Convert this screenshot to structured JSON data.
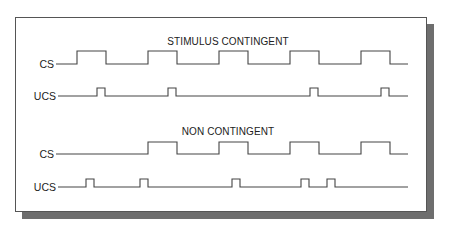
{
  "sections": [
    {
      "title": "STIMULUS CONTINGENT",
      "rows": [
        {
          "label": "CS",
          "start": 56,
          "end": 408,
          "low": 64,
          "high": 51,
          "pulses": [
            [
              77,
              106
            ],
            [
              148,
              177
            ],
            [
              219,
              248
            ],
            [
              290,
              319
            ],
            [
              361,
              390
            ]
          ]
        },
        {
          "label": "UCS",
          "start": 58,
          "end": 408,
          "low": 96,
          "high": 88,
          "pulses": [
            [
              97,
              105
            ],
            [
              168,
              176
            ],
            [
              310,
              318
            ],
            [
              381,
              389
            ]
          ]
        }
      ]
    },
    {
      "title": "NON CONTINGENT",
      "rows": [
        {
          "label": "CS",
          "start": 56,
          "end": 408,
          "low": 154,
          "high": 142,
          "pulses": [
            [
              148,
              177
            ],
            [
              219,
              248
            ],
            [
              290,
              319
            ],
            [
              361,
              390
            ]
          ]
        },
        {
          "label": "UCS",
          "start": 58,
          "end": 408,
          "low": 187,
          "high": 179,
          "pulses": [
            [
              86,
              94
            ],
            [
              140,
              148
            ],
            [
              232,
              240
            ],
            [
              301,
              309
            ],
            [
              327,
              335
            ]
          ]
        }
      ]
    }
  ],
  "layout": {
    "section_title_y": [
      45,
      135
    ],
    "title_x": 228
  }
}
